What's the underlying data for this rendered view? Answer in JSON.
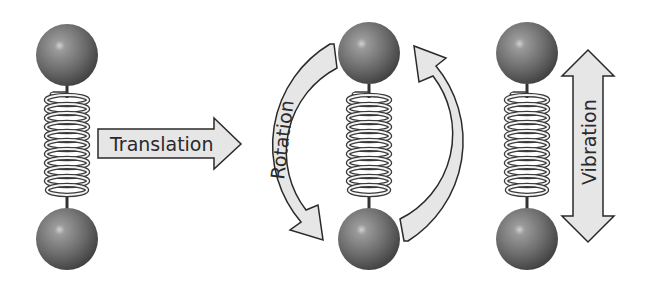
{
  "figure": {
    "colors": {
      "sphere": "#6e6e6e",
      "sphere_highlight": "#c8c8c8",
      "arrow_fill": "#e6e6e6",
      "arrow_stroke": "#2a2a2a",
      "spring": "#3a3a3a",
      "background": "#ffffff"
    },
    "molecules": [
      {
        "id": "molecule-1",
        "center_x": 67
      },
      {
        "id": "molecule-2",
        "center_x": 369
      },
      {
        "id": "molecule-3",
        "center_x": 527
      }
    ],
    "arrows": {
      "translation": {
        "label": "Translation",
        "direction": "right"
      },
      "rotation": {
        "label": "Rotation",
        "direction": "circular"
      },
      "vibration": {
        "label": "Vibration",
        "direction": "up-down"
      }
    }
  }
}
